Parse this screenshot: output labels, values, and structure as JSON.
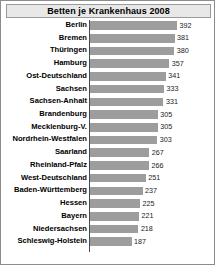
{
  "chart_data": {
    "type": "bar",
    "orientation": "horizontal",
    "title": "Betten je Krankenhaus 2008",
    "xlabel": "",
    "ylabel": "",
    "xlim": [
      0,
      392
    ],
    "grid": false,
    "legend": null,
    "categories": [
      "Berlin",
      "Bremen",
      "Thüringen",
      "Hamburg",
      "Ost-Deutschland",
      "Sachsen",
      "Sachsen-Anhalt",
      "Brandenburg",
      "Mecklenburg-V.",
      "Nordrhein-Westfalen",
      "Saarland",
      "Rheinland-Pfalz",
      "West-Deutschland",
      "Baden-Württemberg",
      "Hessen",
      "Bayern",
      "Niedersachsen",
      "Schleswig-Holstein"
    ],
    "values": [
      392,
      381,
      380,
      357,
      341,
      333,
      331,
      305,
      305,
      303,
      267,
      266,
      251,
      237,
      225,
      221,
      218,
      187
    ],
    "bar_color": "#9d9d9d",
    "background_color": "#ffffff",
    "title_background_color": "#e8e8e8",
    "border_color": "#8c8c8c"
  }
}
